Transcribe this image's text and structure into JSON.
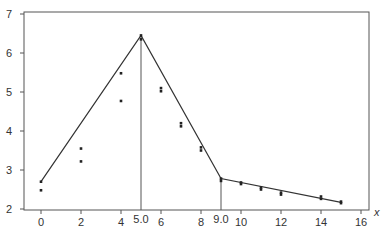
{
  "chart_data": {
    "type": "scatter",
    "title": "",
    "xlabel": "x",
    "ylabel": "",
    "xlim": [
      -0.85,
      16.4
    ],
    "ylim": [
      2,
      7
    ],
    "grid": false,
    "legend": null,
    "x_ticks": [
      0,
      2,
      4,
      6,
      8,
      10,
      12,
      14,
      16
    ],
    "y_ticks": [
      2,
      3,
      4,
      5,
      6,
      7
    ],
    "x_tick_labels": [
      "0",
      "2",
      "4",
      "6",
      "8",
      "10",
      "12",
      "14",
      "16"
    ],
    "y_tick_labels": [
      "2",
      "3",
      "4",
      "5",
      "6",
      "7"
    ],
    "annotations": [
      {
        "x": 5.0,
        "label": "5.0",
        "type": "vertical-line"
      },
      {
        "x": 9.0,
        "label": "9.0",
        "type": "vertical-line"
      }
    ],
    "series": [
      {
        "name": "observations",
        "type": "scatter",
        "points": [
          [
            0,
            2.7
          ],
          [
            0,
            2.48
          ],
          [
            2,
            3.55
          ],
          [
            2,
            3.22
          ],
          [
            4,
            5.48
          ],
          [
            4,
            4.77
          ],
          [
            5,
            6.45
          ],
          [
            5,
            6.35
          ],
          [
            6,
            5.1
          ],
          [
            6,
            5.02
          ],
          [
            7,
            4.2
          ],
          [
            7,
            4.12
          ],
          [
            8,
            3.58
          ],
          [
            8,
            3.5
          ],
          [
            9,
            2.78
          ],
          [
            9,
            2.72
          ],
          [
            10,
            2.68
          ],
          [
            10,
            2.64
          ],
          [
            11,
            2.55
          ],
          [
            11,
            2.5
          ],
          [
            12,
            2.42
          ],
          [
            12,
            2.37
          ],
          [
            14,
            2.32
          ],
          [
            14,
            2.26
          ],
          [
            15,
            2.19
          ],
          [
            15,
            2.15
          ]
        ]
      },
      {
        "name": "piecewise-linear fit",
        "type": "line",
        "points": [
          [
            0,
            2.7
          ],
          [
            5,
            6.45
          ],
          [
            9,
            2.78
          ],
          [
            15,
            2.17
          ]
        ]
      }
    ]
  },
  "axes": {
    "x_axis_label": "x",
    "knot_labels": [
      "5.0",
      "9.0"
    ]
  }
}
